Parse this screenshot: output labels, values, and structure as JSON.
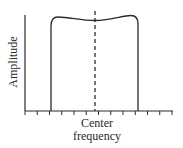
{
  "diagram": {
    "y_axis_label": "Amplitude",
    "x_axis_label_line1": "Center",
    "x_axis_label_line2": "frequency",
    "tick_count": 13,
    "center_marker": "dashed vertical line at center frequency",
    "colors": {
      "stroke": "#2a2a2a",
      "background": "#ffffff"
    }
  }
}
